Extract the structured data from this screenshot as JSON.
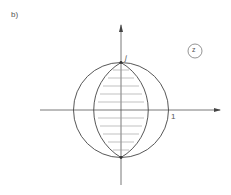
{
  "figure": {
    "panel_label": "b)",
    "imag_unit_label": "j",
    "real_unit_label": "1",
    "plane_label": "z",
    "line_color": "#444444",
    "hatch_color": "#888888"
  }
}
